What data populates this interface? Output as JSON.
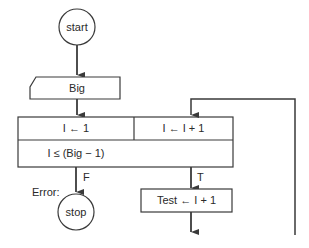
{
  "flowchart": {
    "start": {
      "label": "start"
    },
    "input": {
      "label": "Big"
    },
    "loop_init": {
      "label": "I ← 1"
    },
    "loop_increment": {
      "label": "I ← I + 1"
    },
    "loop_condition": {
      "label": "I ≤ (Big − 1)"
    },
    "false_branch": {
      "label": "F"
    },
    "true_branch": {
      "label": "T"
    },
    "error_label": "Error:",
    "stop": {
      "label": "stop"
    },
    "test_assign": {
      "label": "Test ← I + 1"
    }
  },
  "colors": {
    "stroke": "#3a3a3a",
    "background": "#ffffff"
  }
}
